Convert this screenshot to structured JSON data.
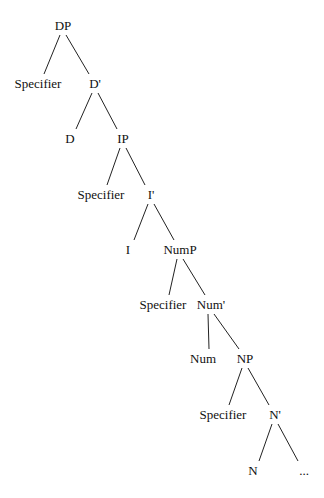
{
  "diagram": {
    "type": "syntax-tree",
    "nodes": [
      {
        "id": "dp",
        "label": "DP",
        "x": 63,
        "y": 30
      },
      {
        "id": "spec1",
        "label": "Specifier",
        "x": 38,
        "y": 88
      },
      {
        "id": "dbar",
        "label": "D'",
        "x": 95,
        "y": 88
      },
      {
        "id": "d",
        "label": "D",
        "x": 70,
        "y": 143
      },
      {
        "id": "ip",
        "label": "IP",
        "x": 123,
        "y": 143
      },
      {
        "id": "spec2",
        "label": "Specifier",
        "x": 101,
        "y": 199
      },
      {
        "id": "ibar",
        "label": "I'",
        "x": 151,
        "y": 199
      },
      {
        "id": "i",
        "label": "I",
        "x": 128,
        "y": 254
      },
      {
        "id": "nump",
        "label": "NumP",
        "x": 180,
        "y": 254
      },
      {
        "id": "spec3",
        "label": "Specifier",
        "x": 163,
        "y": 309
      },
      {
        "id": "numbar",
        "label": "Num'",
        "x": 211,
        "y": 309
      },
      {
        "id": "num",
        "label": "Num",
        "x": 203,
        "y": 363
      },
      {
        "id": "np",
        "label": "NP",
        "x": 245,
        "y": 363
      },
      {
        "id": "spec4",
        "label": "Specifier",
        "x": 223,
        "y": 419
      },
      {
        "id": "nbar",
        "label": "N'",
        "x": 275,
        "y": 419
      },
      {
        "id": "n",
        "label": "N",
        "x": 253,
        "y": 475
      },
      {
        "id": "ellipsis",
        "label": "...",
        "x": 304,
        "y": 475
      }
    ],
    "edges": [
      [
        "dp",
        "spec1"
      ],
      [
        "dp",
        "dbar"
      ],
      [
        "dbar",
        "d"
      ],
      [
        "dbar",
        "ip"
      ],
      [
        "ip",
        "spec2"
      ],
      [
        "ip",
        "ibar"
      ],
      [
        "ibar",
        "i"
      ],
      [
        "ibar",
        "nump"
      ],
      [
        "nump",
        "spec3"
      ],
      [
        "nump",
        "numbar"
      ],
      [
        "numbar",
        "num"
      ],
      [
        "numbar",
        "np"
      ],
      [
        "np",
        "spec4"
      ],
      [
        "np",
        "nbar"
      ],
      [
        "nbar",
        "n"
      ],
      [
        "nbar",
        "ellipsis"
      ]
    ]
  }
}
